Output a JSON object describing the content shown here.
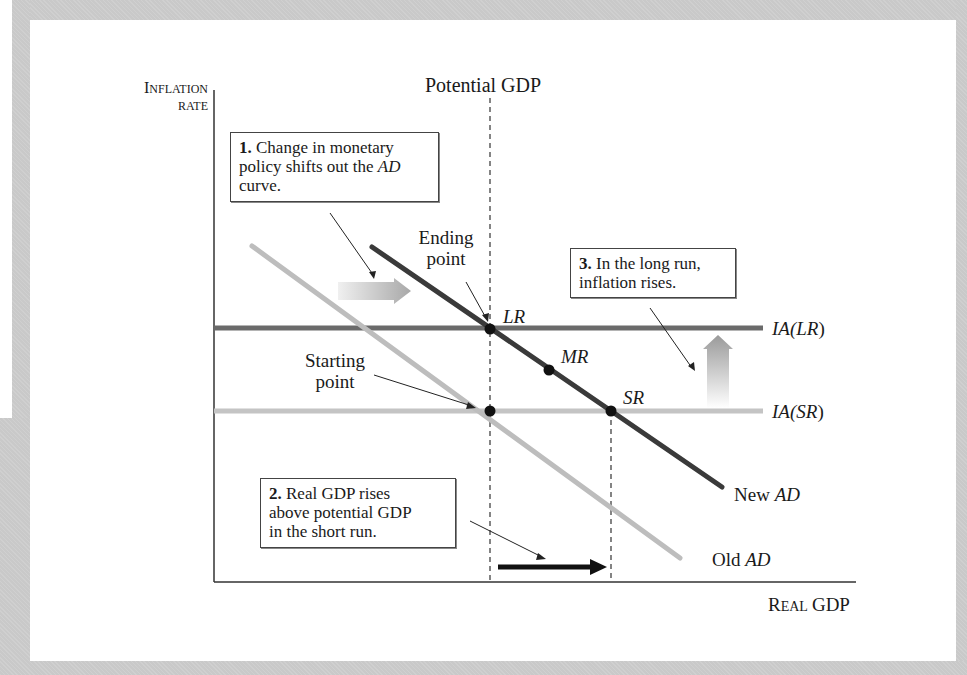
{
  "diagram": {
    "y_axis_label": {
      "line1_cap": "I",
      "line1_rest": "NFLATION",
      "line2": "RATE"
    },
    "x_axis_label": {
      "cap1": "R",
      "rest1": "EAL",
      "word2": "GDP"
    },
    "potential_gdp_label": "Potential GDP",
    "callouts": [
      {
        "number": "1.",
        "text_a": "Change in monetary",
        "text_b": "policy shifts out the ",
        "text_b_italic": "AD",
        "text_c": "curve."
      },
      {
        "number": "2.",
        "text_a": "Real GDP rises",
        "text_b": "above potential GDP",
        "text_c": "in the short run."
      },
      {
        "number": "3.",
        "text_a": "In the long run,",
        "text_b": "inflation rises."
      }
    ],
    "annotations": {
      "ending_point": [
        "Ending",
        "point"
      ],
      "starting_point": [
        "Starting",
        "point"
      ]
    },
    "points": [
      {
        "label": "LR",
        "x": 490,
        "y": 329
      },
      {
        "label": "MR",
        "x": 549,
        "y": 370
      },
      {
        "label": "SR",
        "x": 611,
        "y": 411
      },
      {
        "label": "",
        "x": 490,
        "y": 411
      }
    ],
    "curves": [
      {
        "name": "New AD",
        "prefix": "New ",
        "italic": "AD",
        "color": "#3a3a3a",
        "x1": 372,
        "y1": 247,
        "x2": 722,
        "y2": 487
      },
      {
        "name": "Old AD",
        "prefix": "Old ",
        "italic": "AD",
        "color": "#bdbdbd",
        "x1": 252,
        "y1": 246,
        "x2": 680,
        "y2": 558
      },
      {
        "name": "IA(LR)",
        "label_prefix": "IA(",
        "label_inner": "LR",
        "label_suffix": ")",
        "color": "#6a6a6a",
        "y": 328
      },
      {
        "name": "IA(SR)",
        "label_prefix": "IA(",
        "label_inner": "SR",
        "label_suffix": ")",
        "color": "#c4c4c4",
        "y": 411
      }
    ],
    "colors": {
      "frame": "#c9c9c9",
      "axis": "#333333",
      "new_ad": "#3a3a3a",
      "old_ad": "#bdbdbd",
      "ia_lr": "#6a6a6a",
      "ia_sr": "#c4c4c4"
    }
  }
}
